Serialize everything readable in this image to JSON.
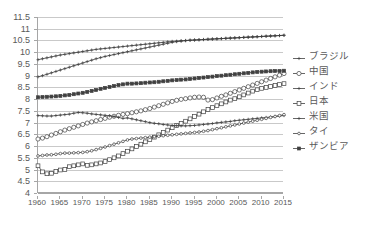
{
  "chart_data": {
    "type": "line",
    "title": "",
    "xlabel": "",
    "ylabel": "",
    "xlim": [
      1960,
      2015
    ],
    "ylim": [
      4,
      11.5
    ],
    "grid": true,
    "legend_position": "right",
    "x_tick_labels": [
      "1960",
      "1965",
      "1970",
      "1975",
      "1980",
      "1985",
      "1990",
      "1995",
      "2000",
      "2005",
      "2010",
      "2015"
    ],
    "y_tick_labels": [
      "4",
      "4.5",
      "5",
      "5.5",
      "6",
      "6.5",
      "7",
      "7.5",
      "8",
      "8.5",
      "9",
      "9.5",
      "10",
      "10.5",
      "11",
      "11.5"
    ],
    "y_ticks": [
      4,
      4.5,
      5,
      5.5,
      6,
      6.5,
      7,
      7.5,
      8,
      8.5,
      9,
      9.5,
      10,
      10.5,
      11,
      11.5
    ],
    "x": [
      1960,
      1961,
      1962,
      1963,
      1964,
      1965,
      1966,
      1967,
      1968,
      1969,
      1970,
      1971,
      1972,
      1973,
      1974,
      1975,
      1976,
      1977,
      1978,
      1979,
      1980,
      1981,
      1982,
      1983,
      1984,
      1985,
      1986,
      1987,
      1988,
      1989,
      1990,
      1991,
      1992,
      1993,
      1994,
      1995,
      1996,
      1997,
      1998,
      1999,
      2000,
      2001,
      2002,
      2003,
      2004,
      2005,
      2006,
      2007,
      2008,
      2009,
      2010,
      2011,
      2012,
      2013,
      2014,
      2015
    ],
    "series": [
      {
        "name": "ブラジル",
        "marker": "plus-small",
        "values": [
          9.68,
          9.72,
          9.76,
          9.8,
          9.84,
          9.88,
          9.91,
          9.94,
          9.97,
          10.0,
          10.03,
          10.06,
          10.09,
          10.12,
          10.14,
          10.16,
          10.18,
          10.2,
          10.22,
          10.24,
          10.26,
          10.28,
          10.3,
          10.32,
          10.34,
          10.36,
          10.38,
          10.4,
          10.42,
          10.44,
          10.46,
          10.47,
          10.49,
          10.5,
          10.51,
          10.52,
          10.53,
          10.54,
          10.55,
          10.56,
          10.57,
          10.58,
          10.59,
          10.6,
          10.61,
          10.62,
          10.63,
          10.64,
          10.65,
          10.66,
          10.67,
          10.68,
          10.69,
          10.7,
          10.71,
          10.72
        ]
      },
      {
        "name": "中国",
        "marker": "circle-open",
        "values": [
          6.3,
          6.34,
          6.4,
          6.47,
          6.54,
          6.61,
          6.68,
          6.74,
          6.8,
          6.86,
          6.92,
          6.98,
          7.03,
          7.08,
          7.13,
          7.18,
          7.23,
          7.27,
          7.31,
          7.35,
          7.38,
          7.42,
          7.46,
          7.5,
          7.55,
          7.6,
          7.66,
          7.72,
          7.78,
          7.84,
          7.9,
          7.95,
          7.99,
          8.02,
          8.05,
          8.08,
          8.09,
          8.08,
          7.96,
          7.98,
          8.05,
          8.12,
          8.18,
          8.25,
          8.32,
          8.39,
          8.46,
          8.53,
          8.6,
          8.67,
          8.74,
          8.81,
          8.88,
          8.95,
          9.02,
          9.09
        ]
      },
      {
        "name": "インド",
        "marker": "plus-small",
        "values": [
          8.95,
          9.0,
          9.06,
          9.12,
          9.18,
          9.24,
          9.3,
          9.36,
          9.42,
          9.48,
          9.54,
          9.6,
          9.66,
          9.72,
          9.77,
          9.82,
          9.86,
          9.9,
          9.94,
          9.98,
          10.02,
          10.06,
          10.1,
          10.14,
          10.18,
          10.22,
          10.26,
          10.3,
          10.34,
          10.38,
          10.42,
          10.45,
          10.47,
          10.49,
          10.51,
          10.52,
          10.53,
          10.54,
          10.55,
          10.56,
          10.57,
          10.58,
          10.59,
          10.6,
          10.61,
          10.62,
          10.63,
          10.64,
          10.65,
          10.66,
          10.67,
          10.68,
          10.69,
          10.7,
          10.71,
          10.72
        ]
      },
      {
        "name": "日本",
        "marker": "square-open",
        "values": [
          5.16,
          4.9,
          4.82,
          4.84,
          4.92,
          4.98,
          5.0,
          5.12,
          5.16,
          5.2,
          5.24,
          5.18,
          5.2,
          5.24,
          5.28,
          5.34,
          5.42,
          5.5,
          5.58,
          5.68,
          5.78,
          5.88,
          5.98,
          6.08,
          6.18,
          6.28,
          6.38,
          6.48,
          6.58,
          6.68,
          6.78,
          6.88,
          6.96,
          7.06,
          7.16,
          7.26,
          7.36,
          7.46,
          7.56,
          7.64,
          7.72,
          7.8,
          7.88,
          7.96,
          8.02,
          8.1,
          8.18,
          8.26,
          8.34,
          8.4,
          8.46,
          8.5,
          8.54,
          8.58,
          8.62,
          8.66
        ]
      },
      {
        "name": "米国",
        "marker": "plus-small",
        "values": [
          7.3,
          7.29,
          7.28,
          7.28,
          7.3,
          7.32,
          7.34,
          7.36,
          7.4,
          7.43,
          7.42,
          7.4,
          7.37,
          7.35,
          7.33,
          7.31,
          7.29,
          7.26,
          7.22,
          7.18,
          7.2,
          7.16,
          7.12,
          7.08,
          7.04,
          7.0,
          6.97,
          6.95,
          6.92,
          6.9,
          6.88,
          6.87,
          6.86,
          6.86,
          6.87,
          6.88,
          6.9,
          6.92,
          6.94,
          6.96,
          6.99,
          7.01,
          7.03,
          7.05,
          7.08,
          7.1,
          7.12,
          7.14,
          7.16,
          7.18,
          7.2,
          7.22,
          7.24,
          7.26,
          7.28,
          7.3
        ]
      },
      {
        "name": "タイ",
        "marker": "circle-small-open",
        "values": [
          5.58,
          5.6,
          5.62,
          5.63,
          5.65,
          5.68,
          5.7,
          5.7,
          5.71,
          5.72,
          5.73,
          5.76,
          5.8,
          5.85,
          5.9,
          5.96,
          6.02,
          6.08,
          6.14,
          6.2,
          6.26,
          6.3,
          6.32,
          6.34,
          6.36,
          6.38,
          6.4,
          6.42,
          6.44,
          6.46,
          6.48,
          6.5,
          6.52,
          6.54,
          6.56,
          6.58,
          6.6,
          6.63,
          6.66,
          6.7,
          6.74,
          6.78,
          6.82,
          6.86,
          6.9,
          6.94,
          6.98,
          7.02,
          7.06,
          7.1,
          7.14,
          7.18,
          7.22,
          7.26,
          7.3,
          7.34
        ]
      },
      {
        "name": "ザンビア",
        "marker": "square-solid",
        "values": [
          8.08,
          8.09,
          8.1,
          8.11,
          8.12,
          8.14,
          8.16,
          8.18,
          8.21,
          8.24,
          8.27,
          8.31,
          8.35,
          8.39,
          8.44,
          8.48,
          8.52,
          8.56,
          8.6,
          8.63,
          8.66,
          8.66,
          8.67,
          8.68,
          8.7,
          8.71,
          8.72,
          8.74,
          8.76,
          8.78,
          8.8,
          8.81,
          8.83,
          8.84,
          8.86,
          8.88,
          8.9,
          8.92,
          8.94,
          8.96,
          8.98,
          9.0,
          9.02,
          9.04,
          9.06,
          9.08,
          9.1,
          9.12,
          9.14,
          9.16,
          9.17,
          9.18,
          9.19,
          9.2,
          9.2,
          9.21
        ]
      }
    ],
    "legend": [
      {
        "label": "ブラジル",
        "marker": "plus-small"
      },
      {
        "label": "中国",
        "marker": "circle-open"
      },
      {
        "label": "インド",
        "marker": "plus-small"
      },
      {
        "label": "日本",
        "marker": "square-open"
      },
      {
        "label": "米国",
        "marker": "plus-small"
      },
      {
        "label": "タイ",
        "marker": "circle-small-open"
      },
      {
        "label": "ザンビア",
        "marker": "square-solid"
      }
    ],
    "colors": {
      "line": "#404040",
      "grid": "#c9c9c9",
      "axis": "#a6a6a6",
      "text": "#595959",
      "background": "#ffffff"
    }
  }
}
